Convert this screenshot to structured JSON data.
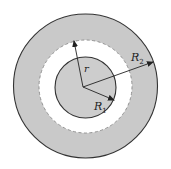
{
  "diagram": {
    "labels": {
      "r": "r",
      "R1_main": "R",
      "R1_sub": "1",
      "R2_main": "R",
      "R2_sub": "2"
    },
    "colors": {
      "shade": "#c8c8c8",
      "inner_shade": "#cdcdcd",
      "gap": "#ffffff",
      "stroke": "#333333"
    }
  }
}
